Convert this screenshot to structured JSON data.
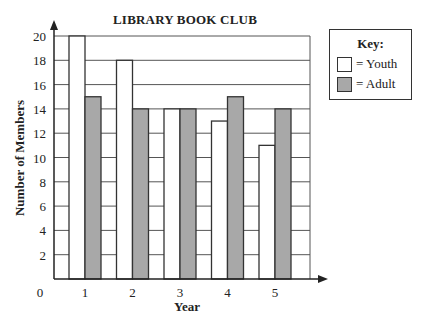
{
  "chart_data": {
    "type": "bar",
    "title": "LIBRARY BOOK CLUB",
    "xlabel": "Year",
    "ylabel": "Number of Members",
    "categories": [
      "1",
      "2",
      "3",
      "4",
      "5"
    ],
    "series": [
      {
        "name": "Youth",
        "values": [
          20,
          18,
          14,
          13,
          11
        ],
        "color": "#ffffff"
      },
      {
        "name": "Adult",
        "values": [
          15,
          14,
          14,
          15,
          14
        ],
        "color": "#a8a8a8"
      }
    ],
    "yticks": [
      0,
      2,
      4,
      6,
      8,
      10,
      12,
      14,
      16,
      18,
      20
    ],
    "ylim": [
      0,
      20
    ],
    "grid": true,
    "legend_position": "right",
    "legend_title": "Key:"
  },
  "legend": {
    "title": "Key:",
    "youth_label": "= Youth",
    "adult_label": "= Adult"
  }
}
